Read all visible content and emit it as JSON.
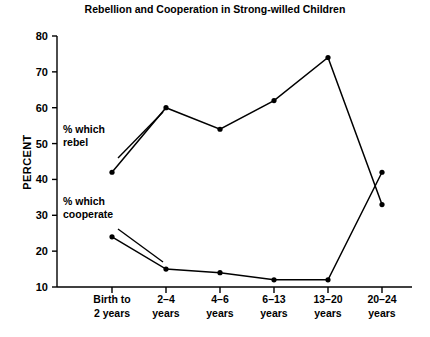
{
  "chart_data": {
    "type": "line",
    "title": "Rebellion and Cooperation in Strong-willed Children",
    "xlabel": "",
    "ylabel": "PERCENT",
    "ylim": [
      10,
      80
    ],
    "yticks": [
      10,
      20,
      30,
      40,
      50,
      60,
      70,
      80
    ],
    "ytick_labels": [
      "10",
      "20",
      "30",
      "40",
      "50",
      "60",
      "70",
      "80"
    ],
    "grid": false,
    "legend_position": "inline-annotations",
    "categories": [
      "Birth to\n2 years",
      "2–4\nyears",
      "4–6\nyears",
      "6–13\nyears",
      "13–20\nyears",
      "20–24\nyears"
    ],
    "category_lines": [
      [
        "Birth to",
        "2 years"
      ],
      [
        "2–4",
        "years"
      ],
      [
        "4–6",
        "years"
      ],
      [
        "6–13",
        "years"
      ],
      [
        "13–20",
        "years"
      ],
      [
        "20–24",
        "years"
      ]
    ],
    "series": [
      {
        "name": "% which rebel",
        "values": [
          42,
          60,
          54,
          62,
          74,
          33
        ]
      },
      {
        "name": "% which cooperate",
        "values": [
          24,
          15,
          14,
          12,
          12,
          42
        ]
      }
    ],
    "annotations": [
      {
        "id": "rebel-annotation",
        "lines": [
          "% which",
          "rebel"
        ],
        "text": "% which rebel",
        "x_px": 63,
        "y_px": 133,
        "leader": {
          "x1": 118,
          "y1": 158,
          "x2": 163,
          "y2": 112
        }
      },
      {
        "id": "cooperate-annotation",
        "lines": [
          "% which",
          "cooperate"
        ],
        "text": "% which cooperate",
        "x_px": 63,
        "y_px": 205,
        "leader": {
          "x1": 118,
          "y1": 229,
          "x2": 163,
          "y2": 262
        }
      }
    ]
  },
  "layout": {
    "plot_left": 57,
    "plot_right": 412,
    "plot_top": 36,
    "plot_bottom": 287,
    "y_top_value": 80,
    "y_bottom_value": 10,
    "category_x": [
      112,
      166,
      220,
      274,
      328,
      382
    ],
    "title_x": 215,
    "title_y": 13,
    "ylabel_x": 31,
    "ylabel_y": 162,
    "cat_label_y1": 303,
    "cat_label_y2": 317,
    "point_radius": 2.6
  }
}
